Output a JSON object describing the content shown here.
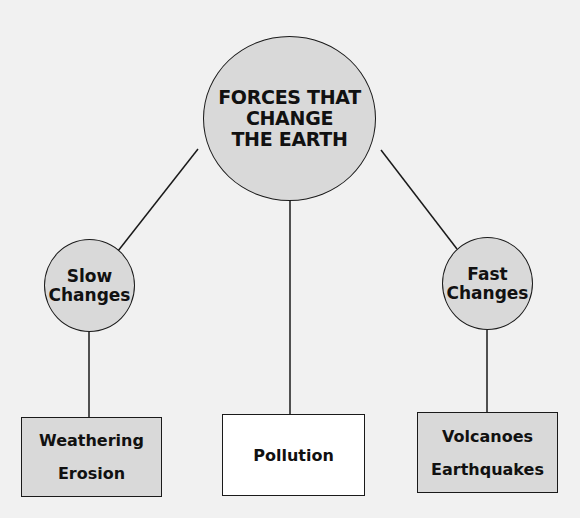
{
  "diagram": {
    "title_node": {
      "label": "FORCES THAT\nCHANGE\nTHE EARTH"
    },
    "branches": [
      {
        "label": "Slow\nChanges",
        "examples": [
          "Weathering",
          "Erosion"
        ]
      },
      {
        "label": null,
        "examples": [
          "Pollution"
        ]
      },
      {
        "label": "Fast\nChanges",
        "examples": [
          "Volcanoes",
          "Earthquakes"
        ]
      }
    ],
    "colors": {
      "background": "#f1f1f1",
      "node_fill": "#d9d9d9",
      "pollution_fill": "#ffffff",
      "stroke": "#1a1a1a"
    }
  }
}
